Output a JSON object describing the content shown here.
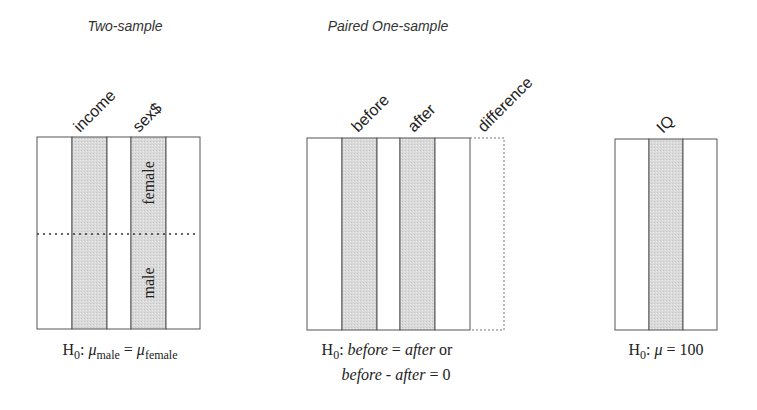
{
  "colors": {
    "shade": "#d9d9d9",
    "border": "#555555",
    "background": "#ffffff"
  },
  "panels": [
    {
      "heading": "Two-sample",
      "columns": [
        {
          "label": "",
          "shaded": false
        },
        {
          "label": "income",
          "shaded": true
        },
        {
          "label": "",
          "shaded": false
        },
        {
          "label": "sex$",
          "shaded": true,
          "groups": [
            "female",
            "male"
          ]
        },
        {
          "label": "",
          "shaded": false
        }
      ],
      "has_group_divider": true,
      "hypothesis": {
        "h": "H",
        "h_sub": "0",
        "colon": ":",
        "mu1": "μ",
        "mu1_sub": "male",
        "eq": "=",
        "mu2": "μ",
        "mu2_sub": "female"
      }
    },
    {
      "heading": "Paired One-sample",
      "columns": [
        {
          "label": "",
          "shaded": false
        },
        {
          "label": "before",
          "shaded": true
        },
        {
          "label": "",
          "shaded": false
        },
        {
          "label": "after",
          "shaded": true
        },
        {
          "label": "",
          "shaded": false
        },
        {
          "label": "difference",
          "shaded": false,
          "dashed": true
        }
      ],
      "hypothesis": {
        "line1": {
          "h": "H",
          "h_sub": "0",
          "colon": ":",
          "a": "before",
          "eq": "=",
          "b": "after",
          "or": "or"
        },
        "line2": {
          "a": "before",
          "minus": "-",
          "b": "after",
          "eq": "=",
          "zero": "0"
        }
      }
    },
    {
      "heading": "",
      "columns": [
        {
          "label": "",
          "shaded": false
        },
        {
          "label": "IQ",
          "shaded": true
        },
        {
          "label": "",
          "shaded": false
        }
      ],
      "hypothesis": {
        "h": "H",
        "h_sub": "0",
        "colon": ":",
        "mu": "μ",
        "eq": "=",
        "value": "100"
      }
    }
  ]
}
